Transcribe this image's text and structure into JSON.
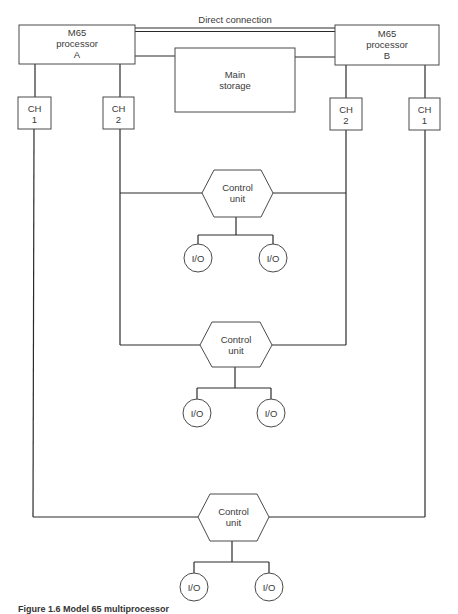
{
  "diagram": {
    "direct_connection_label": "Direct connection",
    "processor_a": {
      "line1": "M65",
      "line2": "processor",
      "line3": "A"
    },
    "processor_b": {
      "line1": "M65",
      "line2": "processor",
      "line3": "B"
    },
    "main_storage": {
      "line1": "Main",
      "line2": "storage"
    },
    "channels": {
      "a_ch1": {
        "line1": "CH",
        "line2": "1"
      },
      "a_ch2": {
        "line1": "CH",
        "line2": "2"
      },
      "b_ch2": {
        "line1": "CH",
        "line2": "2"
      },
      "b_ch1": {
        "line1": "CH",
        "line2": "1"
      }
    },
    "control_units": [
      {
        "line1": "Control",
        "line2": "unit",
        "io": [
          "I/O",
          "I/O"
        ]
      },
      {
        "line1": "Control",
        "line2": "unit",
        "io": [
          "I/O",
          "I/O"
        ]
      },
      {
        "line1": "Control",
        "line2": "unit",
        "io": [
          "I/O",
          "I/O"
        ]
      }
    ],
    "caption": "Figure 1.6   Model 65 multiprocessor"
  },
  "colors": {
    "line": "#2a2a2a",
    "box_stroke": "#4a4a4a",
    "text": "#3a3a3a",
    "background": "#ffffff"
  }
}
